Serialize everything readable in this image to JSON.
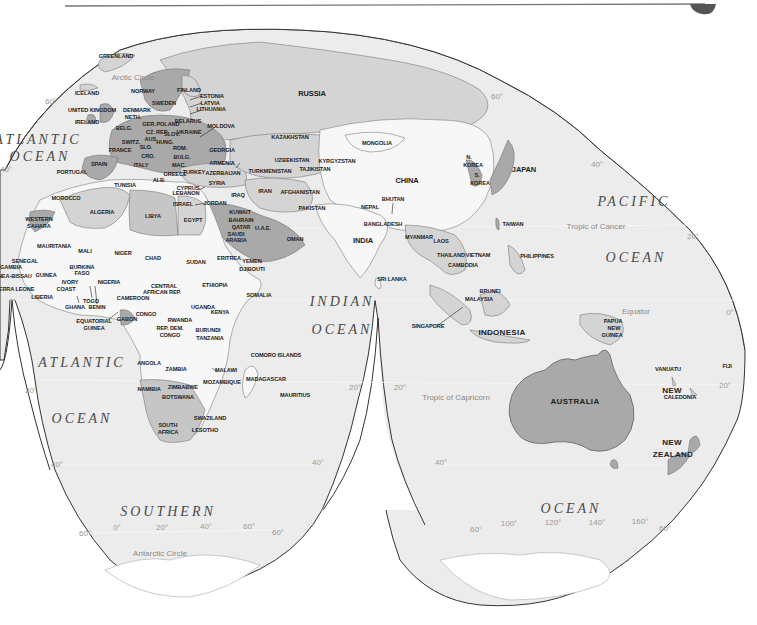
{
  "map": {
    "projection": "interrupted-homolosine",
    "colors": {
      "ocean": "#ececec",
      "land_light": "#f7f7f7",
      "land_mid": "#d4d4d4",
      "land_dark": "#a9a9a9",
      "outline": "#333333",
      "graticule_label": "#9a9a9a",
      "header_rule": "#777777",
      "corner_tab": "#555555"
    },
    "oceans": [
      {
        "id": "atlantic-n",
        "label": "ATLANTIC",
        "x": 38,
        "y": 140
      },
      {
        "id": "atlantic-n2",
        "label": "OCEAN",
        "x": 40,
        "y": 157
      },
      {
        "id": "atlantic-s",
        "label": "ATLANTIC",
        "x": 82,
        "y": 363
      },
      {
        "id": "atlantic-s2",
        "label": "OCEAN",
        "x": 82,
        "y": 419
      },
      {
        "id": "indian",
        "label": "INDIAN",
        "x": 342,
        "y": 302
      },
      {
        "id": "indian2",
        "label": "OCEAN",
        "x": 342,
        "y": 330
      },
      {
        "id": "pacific",
        "label": "PACIFIC",
        "x": 634,
        "y": 202
      },
      {
        "id": "pacific2",
        "label": "OCEAN",
        "x": 636,
        "y": 258
      },
      {
        "id": "southern",
        "label": "SOUTHERN",
        "x": 168,
        "y": 512
      },
      {
        "id": "southern2",
        "label": "OCEAN",
        "x": 571,
        "y": 509
      }
    ],
    "circles": [
      {
        "label": "Arctic Circle",
        "x": 133,
        "y": 78
      },
      {
        "label": "Tropic of Cancer",
        "x": 596,
        "y": 227
      },
      {
        "label": "Equator",
        "x": 636,
        "y": 312
      },
      {
        "label": "Tropic of Capricorn",
        "x": 456,
        "y": 398
      },
      {
        "label": "Antarctic Circle",
        "x": 160,
        "y": 554
      }
    ],
    "graticule_labels": [
      {
        "label": "60°",
        "x": 51,
        "y": 102
      },
      {
        "label": "40°",
        "x": 6,
        "y": 170
      },
      {
        "label": "20°",
        "x": 31,
        "y": 391
      },
      {
        "label": "40°",
        "x": 57,
        "y": 465
      },
      {
        "label": "60°",
        "x": 85,
        "y": 534
      },
      {
        "label": "0°",
        "x": 117,
        "y": 528
      },
      {
        "label": "20°",
        "x": 162,
        "y": 528
      },
      {
        "label": "40°",
        "x": 206,
        "y": 527
      },
      {
        "label": "60°",
        "x": 249,
        "y": 527
      },
      {
        "label": "60°",
        "x": 278,
        "y": 533
      },
      {
        "label": "40°",
        "x": 318,
        "y": 463
      },
      {
        "label": "20°",
        "x": 355,
        "y": 388
      },
      {
        "label": "60°",
        "x": 497,
        "y": 97
      },
      {
        "label": "40°",
        "x": 597,
        "y": 165
      },
      {
        "label": "20°",
        "x": 693,
        "y": 237
      },
      {
        "label": "0°",
        "x": 730,
        "y": 313
      },
      {
        "label": "20°",
        "x": 725,
        "y": 386
      },
      {
        "label": "20°",
        "x": 400,
        "y": 388
      },
      {
        "label": "40°",
        "x": 441,
        "y": 463
      },
      {
        "label": "60°",
        "x": 476,
        "y": 530
      },
      {
        "label": "100°",
        "x": 509,
        "y": 524
      },
      {
        "label": "120°",
        "x": 553,
        "y": 523
      },
      {
        "label": "140°",
        "x": 597,
        "y": 523
      },
      {
        "label": "160°",
        "x": 640,
        "y": 522
      },
      {
        "label": "60°",
        "x": 665,
        "y": 529
      }
    ],
    "countries": [
      {
        "label": "GREENLAND",
        "x": 116,
        "y": 57
      },
      {
        "label": "ICELAND",
        "x": 87,
        "y": 94
      },
      {
        "label": "NORWAY",
        "x": 143,
        "y": 92
      },
      {
        "label": "FINLAND",
        "x": 189,
        "y": 91
      },
      {
        "label": "ESTONIA",
        "x": 212,
        "y": 97
      },
      {
        "label": "LATVIA",
        "x": 210,
        "y": 104
      },
      {
        "label": "LITHUANIA",
        "x": 211,
        "y": 110
      },
      {
        "label": "SWEDEN",
        "x": 164,
        "y": 104
      },
      {
        "label": "UNITED KINGDOM",
        "x": 92,
        "y": 111
      },
      {
        "label": "DENMARK",
        "x": 137,
        "y": 111
      },
      {
        "label": "NETH.",
        "x": 133,
        "y": 118
      },
      {
        "label": "IRELAND",
        "x": 87,
        "y": 123
      },
      {
        "label": "GER.",
        "x": 149,
        "y": 125
      },
      {
        "label": "POLAND",
        "x": 168,
        "y": 125
      },
      {
        "label": "BELARUS",
        "x": 188,
        "y": 122
      },
      {
        "label": "MOLDOVA",
        "x": 221,
        "y": 127
      },
      {
        "label": "BELG.",
        "x": 124,
        "y": 129
      },
      {
        "label": "CZ. REP.",
        "x": 157,
        "y": 133
      },
      {
        "label": "SLOV.",
        "x": 172,
        "y": 135
      },
      {
        "label": "UKRAINE",
        "x": 189,
        "y": 133
      },
      {
        "label": "SWITZ.",
        "x": 131,
        "y": 143
      },
      {
        "label": "AUS.",
        "x": 151,
        "y": 140
      },
      {
        "label": "HUNG.",
        "x": 165,
        "y": 143
      },
      {
        "label": "FRANCE",
        "x": 120,
        "y": 151
      },
      {
        "label": "SLO.",
        "x": 146,
        "y": 148
      },
      {
        "label": "ROM.",
        "x": 180,
        "y": 149
      },
      {
        "label": "GEORGIA",
        "x": 222,
        "y": 151
      },
      {
        "label": "CRO.",
        "x": 148,
        "y": 157
      },
      {
        "label": "BULG.",
        "x": 182,
        "y": 158
      },
      {
        "label": "ARMENIA",
        "x": 222,
        "y": 164
      },
      {
        "label": "SPAIN",
        "x": 99,
        "y": 165
      },
      {
        "label": "ITALY",
        "x": 141,
        "y": 166
      },
      {
        "label": "MAC.",
        "x": 179,
        "y": 166
      },
      {
        "label": "TURKEY",
        "x": 194,
        "y": 173
      },
      {
        "label": "AZERBAIJAN",
        "x": 223,
        "y": 174
      },
      {
        "label": "PORTUGAL",
        "x": 72,
        "y": 173
      },
      {
        "label": "ALB.",
        "x": 159,
        "y": 181
      },
      {
        "label": "GREECE",
        "x": 175,
        "y": 175
      },
      {
        "label": "TUNISIA",
        "x": 125,
        "y": 186
      },
      {
        "label": "CYPRUS",
        "x": 188,
        "y": 189
      },
      {
        "label": "SYRIA",
        "x": 217,
        "y": 184
      },
      {
        "label": "LEBANON",
        "x": 186,
        "y": 194
      },
      {
        "label": "IRAQ",
        "x": 238,
        "y": 196
      },
      {
        "label": "ISRAEL",
        "x": 183,
        "y": 205
      },
      {
        "label": "JORDAN",
        "x": 215,
        "y": 204
      },
      {
        "label": "MOROCCO",
        "x": 66,
        "y": 199
      },
      {
        "label": "ALGERIA",
        "x": 102,
        "y": 213
      },
      {
        "label": "LIBYA",
        "x": 153,
        "y": 217
      },
      {
        "label": "EGYPT",
        "x": 193,
        "y": 221
      },
      {
        "label": "KUWAIT",
        "x": 240,
        "y": 213
      },
      {
        "label": "BAHRAIN",
        "x": 241,
        "y": 221
      },
      {
        "label": "QATAR",
        "x": 241,
        "y": 228
      },
      {
        "label": "U.A.E.",
        "x": 263,
        "y": 229
      },
      {
        "label": "SAUDI",
        "x": 236,
        "y": 235
      },
      {
        "label": "ARABIA",
        "x": 236,
        "y": 241
      },
      {
        "label": "OMAN",
        "x": 295,
        "y": 240
      },
      {
        "label": "WESTERN",
        "x": 39,
        "y": 220
      },
      {
        "label": "SAHARA",
        "x": 39,
        "y": 227
      },
      {
        "label": "MAURITANIA",
        "x": 54,
        "y": 247
      },
      {
        "label": "MALI",
        "x": 85,
        "y": 252
      },
      {
        "label": "NIGER",
        "x": 123,
        "y": 254
      },
      {
        "label": "CHAD",
        "x": 153,
        "y": 259
      },
      {
        "label": "SUDAN",
        "x": 196,
        "y": 263
      },
      {
        "label": "ERITREA",
        "x": 229,
        "y": 259
      },
      {
        "label": "YEMEN",
        "x": 252,
        "y": 262
      },
      {
        "label": "DJIBOUTI",
        "x": 252,
        "y": 270
      },
      {
        "label": "SENEGAL",
        "x": 25,
        "y": 262
      },
      {
        "label": "GAMBIA",
        "x": 11,
        "y": 268
      },
      {
        "label": "BURKINA",
        "x": 82,
        "y": 268
      },
      {
        "label": "FASO",
        "x": 82,
        "y": 274
      },
      {
        "label": "GUINEA-BISSAU",
        "x": 10,
        "y": 277
      },
      {
        "label": "GUINEA",
        "x": 46,
        "y": 276
      },
      {
        "label": "IVORY",
        "x": 70,
        "y": 283
      },
      {
        "label": "COAST",
        "x": 66,
        "y": 290
      },
      {
        "label": "NIGERIA",
        "x": 109,
        "y": 283
      },
      {
        "label": "CENTRAL",
        "x": 164,
        "y": 287
      },
      {
        "label": "AFRICAN REP.",
        "x": 162,
        "y": 293
      },
      {
        "label": "ETHIOPIA",
        "x": 215,
        "y": 286
      },
      {
        "label": "SOMALIA",
        "x": 259,
        "y": 296
      },
      {
        "label": "SIERRA LEONE",
        "x": 14,
        "y": 290
      },
      {
        "label": "LIBERIA",
        "x": 42,
        "y": 298
      },
      {
        "label": "GHANA",
        "x": 75,
        "y": 308
      },
      {
        "label": "TOGO",
        "x": 91,
        "y": 302
      },
      {
        "label": "BENIN",
        "x": 97,
        "y": 308
      },
      {
        "label": "CAMEROON",
        "x": 133,
        "y": 299
      },
      {
        "label": "UGANDA",
        "x": 203,
        "y": 308
      },
      {
        "label": "KENYA",
        "x": 220,
        "y": 313
      },
      {
        "label": "CONGO",
        "x": 146,
        "y": 315
      },
      {
        "label": "RWANDA",
        "x": 180,
        "y": 321
      },
      {
        "label": "GABON",
        "x": 127,
        "y": 320
      },
      {
        "label": "EQUATORIAL",
        "x": 94,
        "y": 322
      },
      {
        "label": "GUINEA",
        "x": 94,
        "y": 329
      },
      {
        "label": "BURUNDI",
        "x": 208,
        "y": 331
      },
      {
        "label": "REP. DEM.",
        "x": 170,
        "y": 329
      },
      {
        "label": "CONGO",
        "x": 170,
        "y": 336
      },
      {
        "label": "TANZANIA",
        "x": 210,
        "y": 339
      },
      {
        "label": "COMORO ISLANDS",
        "x": 276,
        "y": 356
      },
      {
        "label": "ANGOLA",
        "x": 149,
        "y": 364
      },
      {
        "label": "ZAMBIA",
        "x": 176,
        "y": 370
      },
      {
        "label": "MALAWI",
        "x": 226,
        "y": 371
      },
      {
        "label": "MADAGASCAR",
        "x": 266,
        "y": 380
      },
      {
        "label": "ZIMBABWE",
        "x": 183,
        "y": 388
      },
      {
        "label": "MOZAMBIQUE",
        "x": 222,
        "y": 383
      },
      {
        "label": "MAURITIUS",
        "x": 295,
        "y": 396
      },
      {
        "label": "NAMIBIA",
        "x": 149,
        "y": 390
      },
      {
        "label": "BOTSWANA",
        "x": 178,
        "y": 398
      },
      {
        "label": "SWAZILAND",
        "x": 210,
        "y": 419
      },
      {
        "label": "SOUTH",
        "x": 168,
        "y": 426
      },
      {
        "label": "AFRICA",
        "x": 168,
        "y": 433
      },
      {
        "label": "LESOTHO",
        "x": 205,
        "y": 431
      },
      {
        "label": "RUSSIA",
        "x": 312,
        "y": 94
      },
      {
        "label": "KAZAKHSTAN",
        "x": 290,
        "y": 138
      },
      {
        "label": "MONGOLIA",
        "x": 377,
        "y": 144
      },
      {
        "label": "UZBEKISTAN",
        "x": 292,
        "y": 161
      },
      {
        "label": "KYRGYZSTAN",
        "x": 337,
        "y": 162
      },
      {
        "label": "TURKMENISTAN",
        "x": 270,
        "y": 172
      },
      {
        "label": "TAJIKISTAN",
        "x": 315,
        "y": 170
      },
      {
        "label": "IRAN",
        "x": 265,
        "y": 192
      },
      {
        "label": "AFGHANISTAN",
        "x": 300,
        "y": 193
      },
      {
        "label": "CHINA",
        "x": 407,
        "y": 181
      },
      {
        "label": "N.",
        "x": 469,
        "y": 158
      },
      {
        "label": "KOREA",
        "x": 473,
        "y": 166
      },
      {
        "label": "S.",
        "x": 477,
        "y": 176
      },
      {
        "label": "KOREA",
        "x": 480,
        "y": 184
      },
      {
        "label": "JAPAN",
        "x": 524,
        "y": 170
      },
      {
        "label": "PAKISTAN",
        "x": 312,
        "y": 209
      },
      {
        "label": "NEPAL",
        "x": 370,
        "y": 208
      },
      {
        "label": "BHUTAN",
        "x": 393,
        "y": 200
      },
      {
        "label": "BANGLADESH",
        "x": 383,
        "y": 225
      },
      {
        "label": "INDIA",
        "x": 363,
        "y": 241
      },
      {
        "label": "MYANMAR",
        "x": 419,
        "y": 238
      },
      {
        "label": "LAOS",
        "x": 441,
        "y": 242
      },
      {
        "label": "TAIWAN",
        "x": 513,
        "y": 225
      },
      {
        "label": "THAILAND",
        "x": 451,
        "y": 256
      },
      {
        "label": "VIETNAM",
        "x": 478,
        "y": 256
      },
      {
        "label": "CAMBODIA",
        "x": 463,
        "y": 266
      },
      {
        "label": "PHILIPPINES",
        "x": 537,
        "y": 257
      },
      {
        "label": "SRI LANKA",
        "x": 392,
        "y": 280
      },
      {
        "label": "BRUNEI",
        "x": 490,
        "y": 292
      },
      {
        "label": "MALAYSIA",
        "x": 479,
        "y": 300
      },
      {
        "label": "SINGAPORE",
        "x": 428,
        "y": 327
      },
      {
        "label": "INDONESIA",
        "x": 502,
        "y": 333
      },
      {
        "label": "PAPUA",
        "x": 613,
        "y": 322
      },
      {
        "label": "NEW",
        "x": 614,
        "y": 329
      },
      {
        "label": "GUINEA",
        "x": 612,
        "y": 336
      },
      {
        "label": "VANUATU",
        "x": 668,
        "y": 370
      },
      {
        "label": "FIJI",
        "x": 727,
        "y": 367
      },
      {
        "label": "NEW",
        "x": 672,
        "y": 391
      },
      {
        "label": "CALEDONIA",
        "x": 680,
        "y": 398
      },
      {
        "label": "AUSTRALIA",
        "x": 575,
        "y": 402
      },
      {
        "label": "NEW",
        "x": 672,
        "y": 443
      },
      {
        "label": "ZEALAND",
        "x": 673,
        "y": 455
      }
    ]
  }
}
